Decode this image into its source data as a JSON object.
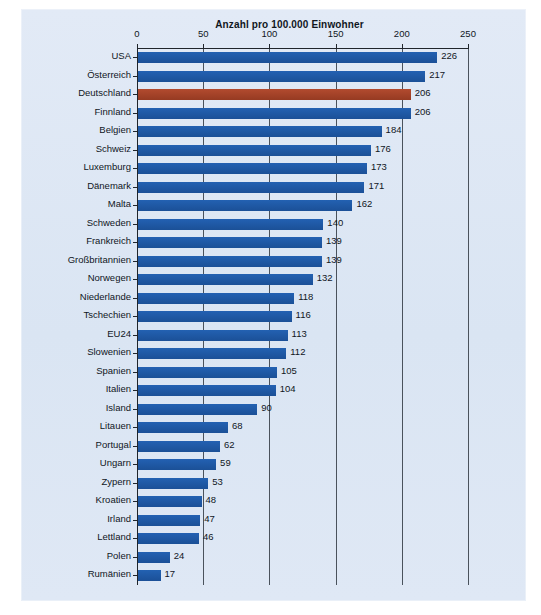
{
  "chart_data": {
    "type": "bar",
    "orientation": "horizontal",
    "title": "Anzahl pro 100.000 Einwohner",
    "xlabel": "",
    "ylabel": "",
    "xlim": [
      0,
      250
    ],
    "xticks": [
      0,
      50,
      100,
      150,
      200,
      250
    ],
    "xtick_labels": [
      "0",
      "50",
      "100",
      "150",
      "200",
      "250"
    ],
    "grid": "vertical",
    "legend": "none",
    "bar_color": "#1d5aa9",
    "highlight_color": "#a8442a",
    "highlight_category": "Deutschland",
    "panel_background": "#dde7f4",
    "categories": [
      "USA",
      "Österreich",
      "Deutschland",
      "Finnland",
      "Belgien",
      "Schweiz",
      "Luxemburg",
      "Dänemark",
      "Malta",
      "Schweden",
      "Frankreich",
      "Großbritannien",
      "Norwegen",
      "Niederlande",
      "Tschechien",
      "EU24",
      "Slowenien",
      "Spanien",
      "Italien",
      "Island",
      "Litauen",
      "Portugal",
      "Ungarn",
      "Zypern",
      "Kroatien",
      "Irland",
      "Lettland",
      "Polen",
      "Rumänien"
    ],
    "values": [
      226,
      217,
      206,
      206,
      184,
      176,
      173,
      171,
      162,
      140,
      139,
      139,
      132,
      118,
      116,
      113,
      112,
      105,
      104,
      90,
      68,
      62,
      59,
      53,
      48,
      47,
      46,
      24,
      17
    ],
    "value_labels": [
      "226",
      "217",
      "206",
      "206",
      "184",
      "176",
      "173",
      "171",
      "162",
      "140",
      "139",
      "139",
      "132",
      "118",
      "116",
      "113",
      "112",
      "105",
      "104",
      "90",
      "68",
      "62",
      "59",
      "53",
      "48",
      "47",
      "46",
      "24",
      "17"
    ]
  },
  "footnote": ""
}
